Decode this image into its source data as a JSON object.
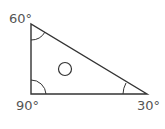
{
  "diagram": {
    "type": "right-triangle",
    "angles": {
      "top_left": "60°",
      "bottom_left": "90°",
      "bottom_right": "30°"
    },
    "center_mark": "circle",
    "colors": {
      "stroke": "#333333",
      "label": "#555555"
    }
  }
}
